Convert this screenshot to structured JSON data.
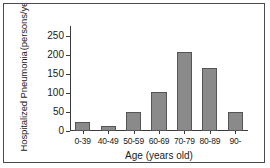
{
  "chart_data": {
    "type": "bar",
    "title": "",
    "subtitle": "",
    "xlabel": "Age (years old)",
    "ylabel": "Hospitalized Pneumonia (persons/year)",
    "ylabel_line1": "Hospitalized Pneumonia",
    "ylabel_line2": "(persons/year)",
    "categories": [
      "0-39",
      "40-49",
      "50-59",
      "60-69",
      "70-79",
      "80-89",
      "90-"
    ],
    "values": [
      24,
      13,
      49,
      101,
      208,
      165,
      51
    ],
    "ylim": [
      0,
      275
    ],
    "yticks": [
      0,
      50,
      100,
      150,
      200,
      250
    ],
    "ytick_labels": [
      "0",
      "50",
      "100",
      "150",
      "200",
      "250"
    ],
    "grid": false,
    "legend": false,
    "bar_color": "#8a8a8a",
    "bar_edge_color": "#555555",
    "axis_color": "#3a3a3a",
    "frame_color": "#4a4a4a",
    "text_color": "#1a1a1a"
  }
}
